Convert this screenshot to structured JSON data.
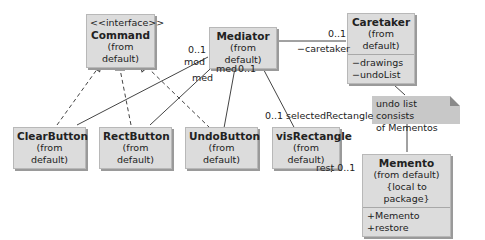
{
  "diagram": {
    "type": "UML class diagram (Memento pattern)",
    "classes": {
      "command": {
        "stereotype": "<<interface>>",
        "name": "Command",
        "package": "(from default)"
      },
      "mediator": {
        "name": "Mediator",
        "package": "(from default)"
      },
      "caretaker": {
        "name": "Caretaker",
        "package": "(from default)",
        "attributes": [
          "−drawings",
          "−undoList"
        ]
      },
      "clear_button": {
        "name": "ClearButton",
        "package": "(from default)"
      },
      "rect_button": {
        "name": "RectButton",
        "package": "(from default)"
      },
      "undo_button": {
        "name": "UndoButton",
        "package": "(from default)"
      },
      "vis_rectangle": {
        "name": "visRectangle",
        "package": "(from default)"
      },
      "memento": {
        "name": "Memento",
        "package": "(from default)",
        "constraint": "{local to package}",
        "operations": [
          "+Memento",
          "+restore"
        ]
      }
    },
    "note": {
      "line1": "undo list consists",
      "line2": "of Mementos"
    },
    "labels": {
      "mod_mult": "0..1",
      "mod_role": "mod",
      "med_role_1": "med",
      "med_role_2": "med",
      "med_mult": "0..1",
      "caretaker_mult": "0..1",
      "caretaker_role": "−caretaker",
      "selrect_mult": "0..1",
      "selrect_role": "selectedRectangle",
      "rest_label": "rest 0..1"
    }
  }
}
